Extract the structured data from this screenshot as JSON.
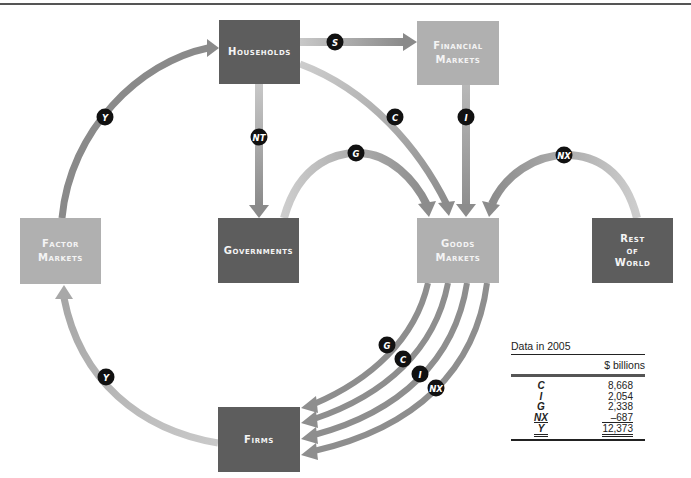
{
  "diagram": {
    "nodes": {
      "households": {
        "label_line1": "Households",
        "shade": "dark"
      },
      "financial_markets": {
        "label_line1": "Financial",
        "label_line2": "Markets",
        "shade": "light"
      },
      "factor_markets": {
        "label_line1": "Factor",
        "label_line2": "Markets",
        "shade": "light"
      },
      "governments": {
        "label_line1": "Governments",
        "shade": "dark"
      },
      "goods_markets": {
        "label_line1": "Goods",
        "label_line2": "Markets",
        "shade": "light"
      },
      "rest_of_world": {
        "label_line1": "Rest",
        "label_line2": "of",
        "label_line3": "World",
        "shade": "dark"
      },
      "firms": {
        "label_line1": "Firms",
        "shade": "dark"
      }
    },
    "flows": [
      {
        "id": "y-factor-to-households",
        "label": "Y",
        "from": "Factor Markets",
        "to": "Households"
      },
      {
        "id": "s-households-to-financial",
        "label": "S",
        "from": "Households",
        "to": "Financial Markets"
      },
      {
        "id": "nt-households-to-governments",
        "label": "NT",
        "from": "Households",
        "to": "Governments"
      },
      {
        "id": "c-households-to-goods",
        "label": "C",
        "from": "Households",
        "to": "Goods Markets"
      },
      {
        "id": "i-financial-to-goods",
        "label": "I",
        "from": "Financial Markets",
        "to": "Goods Markets"
      },
      {
        "id": "g-governments-to-goods",
        "label": "G",
        "from": "Governments",
        "to": "Goods Markets"
      },
      {
        "id": "nx-rest-of-world-to-goods",
        "label": "NX",
        "from": "Rest of World",
        "to": "Goods Markets"
      },
      {
        "id": "g-goods-to-firms",
        "label": "G",
        "from": "Goods Markets",
        "to": "Firms"
      },
      {
        "id": "c-goods-to-firms",
        "label": "C",
        "from": "Goods Markets",
        "to": "Firms"
      },
      {
        "id": "i-goods-to-firms",
        "label": "I",
        "from": "Goods Markets",
        "to": "Firms"
      },
      {
        "id": "nx-goods-to-firms",
        "label": "NX",
        "from": "Goods Markets",
        "to": "Firms"
      },
      {
        "id": "y-firms-to-factor",
        "label": "Y",
        "from": "Firms",
        "to": "Factor Markets"
      }
    ],
    "colors": {
      "dark_box": "#5d5d5d",
      "light_box": "#b0b0b0",
      "arrow_dark": "#8a8a8a",
      "arrow_light": "#c4c4c4",
      "badge": "#111111"
    }
  },
  "table": {
    "caption": "Data in 2005",
    "unit_header": "$ billions",
    "rows": [
      {
        "key": "C",
        "value": "8,668"
      },
      {
        "key": "I",
        "value": "2,054"
      },
      {
        "key": "G",
        "value": "2,338"
      },
      {
        "key": "NX",
        "value": "–687"
      }
    ],
    "total": {
      "key": "Y",
      "value": "12,373"
    }
  }
}
